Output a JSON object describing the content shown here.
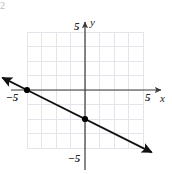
{
  "figure": {
    "corner_mark": "2",
    "axis_labels": {
      "x": "x",
      "y": "y"
    },
    "tick_labels": {
      "y_positive": "5",
      "y_negative": "−5",
      "x_negative": "−5",
      "x_positive": "5"
    },
    "colors": {
      "grid": "#e4e4ea",
      "axis": "#3a3a3a",
      "line": "#111111",
      "point": "#000000",
      "text": "#1a1a1a"
    }
  },
  "chart_data": {
    "type": "line",
    "title": "",
    "xlabel": "x",
    "ylabel": "y",
    "xlim": [
      -5,
      5
    ],
    "ylim": [
      -5,
      5
    ],
    "xticks": [
      -5,
      5
    ],
    "yticks": [
      -5,
      5
    ],
    "xtick_labels": [
      "−5",
      "5"
    ],
    "ytick_labels": [
      "−5",
      "5"
    ],
    "grid": true,
    "grid_step": 1,
    "legend": null,
    "series": [
      {
        "name": "line",
        "equation": "y = -0.5x - 2",
        "slope": -0.5,
        "intercept": -2,
        "arrows": [
          "start",
          "end"
        ],
        "endpoints": [
          {
            "x": -5.7,
            "y": 0.85
          },
          {
            "x": 4.6,
            "y": -4.3
          }
        ],
        "points": [
          {
            "x": -4,
            "y": 0,
            "label": ""
          },
          {
            "x": 0,
            "y": -2,
            "label": ""
          }
        ]
      }
    ]
  }
}
